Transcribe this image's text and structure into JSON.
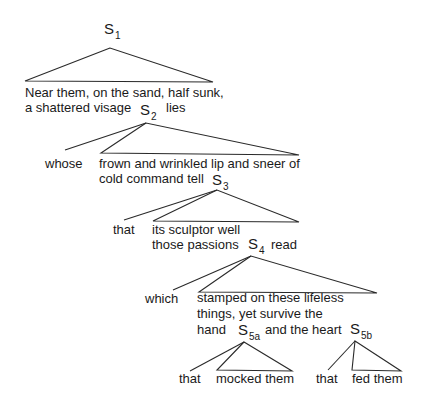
{
  "nodes": {
    "s1": {
      "label": "S",
      "sub": "1"
    },
    "s2": {
      "label": "S",
      "sub": "2"
    },
    "s3": {
      "label": "S",
      "sub": "3"
    },
    "s4": {
      "label": "S",
      "sub": "4"
    },
    "s5a": {
      "label": "S",
      "sub": "5a"
    },
    "s5b": {
      "label": "S",
      "sub": "5b"
    }
  },
  "text": {
    "s1_line1": "Near them, on the sand, half sunk,",
    "s1_line2": "a shattered visage",
    "s1_after": "lies",
    "whose": "whose",
    "s2_line1": "frown and wrinkled lip and sneer of",
    "s2_line2": "cold command tell",
    "that1": "that",
    "s3_line1": "its sculptor well",
    "s3_line2": "those passions",
    "s3_after": "read",
    "which": "which",
    "s4_line1": "stamped on these lifeless",
    "s4_line2": "things, yet survive the",
    "s4_line3a": "hand",
    "s4_line3b": "and the heart",
    "that2": "that",
    "mocked": "mocked them",
    "that3": "that",
    "fed": "fed them"
  }
}
